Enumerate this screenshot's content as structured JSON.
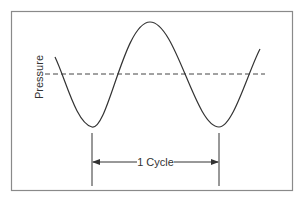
{
  "diagram": {
    "type": "waveform",
    "y_axis_label": "Pressure",
    "cycle_label": "1 Cycle",
    "colors": {
      "frame": "#8a8a8a",
      "curve": "#333333",
      "dashed_line": "#444444",
      "text": "#333333",
      "background": "#ffffff"
    },
    "elements": [
      {
        "name": "sine-wave",
        "description": "Pressure wave oscillating around mean line, two troughs and one peak"
      },
      {
        "name": "mean-pressure-line",
        "style": "dashed",
        "description": "Horizontal dashed line marking average pressure"
      },
      {
        "name": "cycle-marker",
        "description": "Double-headed arrow spanning trough to trough labeled 1 Cycle"
      }
    ]
  }
}
